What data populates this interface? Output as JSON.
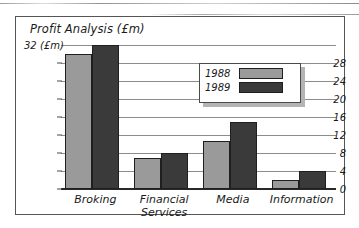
{
  "figure": {
    "title": "Profit Analysis (£m)",
    "top_tick_unit_label": "32 (£m)",
    "frame_color": "#555555",
    "gridline_color": "#8c8c8c",
    "axis_color": "#2a2a2a"
  },
  "legend": {
    "position": "upper-right-inside",
    "entries": [
      {
        "label": "1988",
        "color": "#9a9a9a"
      },
      {
        "label": "1989",
        "color": "#3a3a3a"
      }
    ]
  },
  "chart_data": {
    "type": "bar",
    "title": "Profit Analysis (£m)",
    "xlabel": "",
    "ylabel": "£m",
    "ylim": [
      0,
      32
    ],
    "yticks": [
      0,
      4,
      8,
      12,
      16,
      20,
      24,
      28,
      32
    ],
    "ytick_labels": [
      "0",
      "4",
      "8",
      "12",
      "16",
      "20",
      "24",
      "28",
      "32 (£m)"
    ],
    "grid": true,
    "categories": [
      "Broking",
      "Financial\nServices",
      "Media",
      "Information"
    ],
    "series": [
      {
        "name": "1988",
        "color": "#9a9a9a",
        "values": [
          30,
          7,
          10.7,
          2
        ]
      },
      {
        "name": "1989",
        "color": "#3a3a3a",
        "values": [
          32,
          8,
          15,
          4
        ]
      }
    ]
  }
}
